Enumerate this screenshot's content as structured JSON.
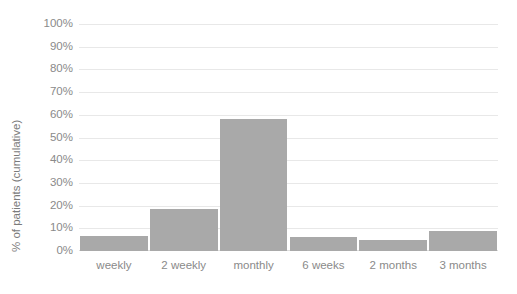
{
  "chart_data": {
    "type": "bar",
    "title": "",
    "subtitle": "",
    "xlabel": "",
    "ylabel": "% of patients (cumulative)",
    "categories": [
      "weekly",
      "2 weekly",
      "monthly",
      "6 weeks",
      "2 months",
      "3 months"
    ],
    "values": [
      6.5,
      18.5,
      58,
      6,
      5,
      9
    ],
    "ylim": [
      0,
      100
    ],
    "yticks": [
      0,
      10,
      20,
      30,
      40,
      50,
      60,
      70,
      80,
      90,
      100
    ],
    "ytick_labels": [
      "0%",
      "10%",
      "20%",
      "30%",
      "40%",
      "50%",
      "60%",
      "70%",
      "80%",
      "90%",
      "100%"
    ],
    "grid": true,
    "legend": null,
    "legend_position": "none",
    "series": [
      {
        "name": "% of patients (cumulative)",
        "values": [
          6.5,
          18.5,
          58,
          6,
          5,
          9
        ]
      }
    ],
    "colors": {
      "bar": "#a9a9a9",
      "gridline": "#e8e8e8",
      "baseline": "#dddddd",
      "tick_label": "#8a8a8a",
      "axis_title": "#7b7b7b",
      "background": "#ffffff"
    }
  }
}
